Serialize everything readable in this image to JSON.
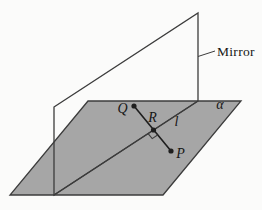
{
  "figure": {
    "width": 262,
    "height": 210,
    "background": "#fbfbfa"
  },
  "colors": {
    "plane_fill": "#a6a6a6",
    "stroke": "#3c3c3c",
    "point_fill": "#1e1e1e",
    "label_color": "#161616"
  },
  "plane": {
    "points": "88,101 241,101 163,195 10,195",
    "label": "α",
    "label_x": 220,
    "label_y": 109
  },
  "mirror": {
    "points": "54,107 198,13 198,101 54,195",
    "label": "Mirror",
    "label_x": 217,
    "label_y": 56,
    "leader": {
      "x1": 198,
      "y1": 56.5,
      "x2": 215,
      "y2": 51
    }
  },
  "line_l": {
    "x1": 54,
    "y1": 195,
    "x2": 198,
    "y2": 101,
    "label": "l",
    "label_x": 176.5,
    "label_y": 126
  },
  "segment_qp": {
    "x1": 134,
    "y1": 106,
    "x2": 171,
    "y2": 151
  },
  "right_angle_mark": {
    "points": "148.1,133.6 152.2,138.6 157.6,135"
  },
  "points": {
    "Q": {
      "x": 134,
      "y": 106,
      "label": "Q",
      "label_x": 122.5,
      "label_y": 113
    },
    "R": {
      "x": 153.5,
      "y": 130,
      "label": "R",
      "label_x": 152.5,
      "label_y": 122
    },
    "P": {
      "x": 171,
      "y": 151,
      "label": "P",
      "label_x": 180.5,
      "label_y": 158
    }
  }
}
